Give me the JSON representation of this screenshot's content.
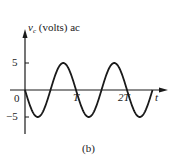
{
  "figure": {
    "caption": "(b)"
  },
  "chart_data": {
    "type": "line",
    "ylabel_var": "v",
    "ylabel_sub": "c",
    "ylabel_rest": " (volts) ac",
    "xlabel": "t",
    "x_tick_labels": [
      "0",
      "T",
      "2T"
    ],
    "y_tick_labels": [
      "5",
      "-5"
    ],
    "y_ticks": [
      5,
      -5
    ],
    "ylim": [
      -5,
      5
    ],
    "xlim_periods": [
      0,
      2.5
    ],
    "grid": false,
    "legend": null,
    "series": [
      {
        "name": "v_c",
        "function": "-5*sin(2*pi*t/T)",
        "x": [
          0,
          0.25,
          0.5,
          0.75,
          1.0,
          1.25,
          1.5,
          1.75,
          2.0,
          2.25,
          2.5
        ],
        "x_units": "T",
        "values": [
          0,
          -5,
          0,
          5,
          0,
          -5,
          0,
          5,
          0,
          -5,
          0
        ]
      }
    ],
    "amplitude": 5,
    "color": "#1a1a1a"
  },
  "labels": {
    "y5": "5",
    "ym5": "−5",
    "x0": "0",
    "xT": "T",
    "x2T": "2T",
    "xt": "t"
  }
}
